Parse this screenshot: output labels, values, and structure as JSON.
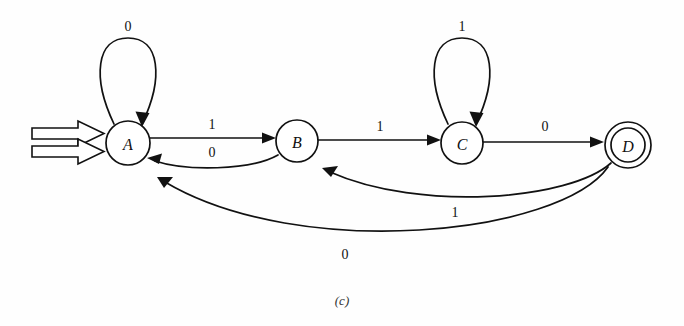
{
  "figure": {
    "caption": "(c)",
    "type": "finite-state-machine",
    "background_color": "#fefefe",
    "line_color": "#111111"
  },
  "states": [
    {
      "id": "A",
      "label": "A",
      "cx": 128,
      "cy": 143,
      "r": 22,
      "accepting": false,
      "start": true
    },
    {
      "id": "B",
      "label": "B",
      "cx": 297,
      "cy": 141,
      "r": 21,
      "accepting": false,
      "start": false
    },
    {
      "id": "C",
      "label": "C",
      "cx": 462,
      "cy": 143,
      "r": 21,
      "accepting": false,
      "start": false
    },
    {
      "id": "D",
      "label": "D",
      "cx": 628,
      "cy": 145,
      "r": 23,
      "r_inner": 17,
      "accepting": true,
      "start": false
    }
  ],
  "transitions": [
    {
      "from": "A",
      "to": "A",
      "label": "0",
      "kind": "self-loop",
      "label_x": 128,
      "label_y": 26
    },
    {
      "from": "A",
      "to": "B",
      "label": "1",
      "kind": "straight",
      "label_x": 212,
      "label_y": 124
    },
    {
      "from": "B",
      "to": "A",
      "label": "0",
      "kind": "curve",
      "label_x": 212,
      "label_y": 152
    },
    {
      "from": "B",
      "to": "C",
      "label": "1",
      "kind": "straight",
      "label_x": 380,
      "label_y": 126
    },
    {
      "from": "C",
      "to": "C",
      "label": "1",
      "kind": "self-loop",
      "label_x": 462,
      "label_y": 26
    },
    {
      "from": "C",
      "to": "D",
      "label": "0",
      "kind": "straight",
      "label_x": 545,
      "label_y": 126
    },
    {
      "from": "D",
      "to": "B",
      "label": "1",
      "kind": "curve",
      "label_x": 455,
      "label_y": 212
    },
    {
      "from": "D",
      "to": "A",
      "label": "0",
      "kind": "curve",
      "label_x": 345,
      "label_y": 254
    }
  ],
  "start_indicator": {
    "name": "start-arrow",
    "target": "A",
    "style": "double-hollow-arrow"
  }
}
